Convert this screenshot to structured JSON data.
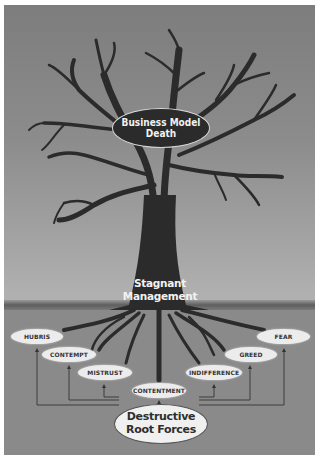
{
  "diagram": {
    "top_label": {
      "line1": "Business Model",
      "line2": "Death"
    },
    "trunk_label": {
      "line1": "Stagnant",
      "line2": "Management"
    },
    "root_source": {
      "line1": "Destructive",
      "line2": "Root Forces"
    },
    "root_causes": [
      {
        "label": "HUBRIS"
      },
      {
        "label": "CONTEMPT"
      },
      {
        "label": "MISTRUST"
      },
      {
        "label": "CONTENTMENT"
      },
      {
        "label": "INDIFFERENCE"
      },
      {
        "label": "GREED"
      },
      {
        "label": "FEAR"
      }
    ],
    "colors": {
      "sky": "#8c8c8c",
      "ground": "#8a8a8a",
      "tree": "#2b2b2b",
      "label_bg": "#ececec"
    }
  }
}
